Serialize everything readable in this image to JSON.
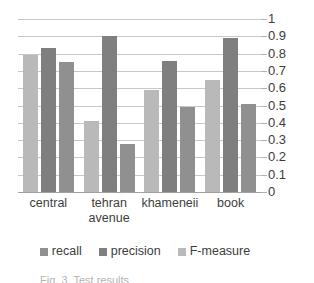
{
  "chart_data": {
    "type": "bar",
    "title": "",
    "xlabel": "",
    "ylabel": "",
    "ylim": [
      0,
      1
    ],
    "ytick_labels": [
      "1",
      "0.9",
      "0.8",
      "0.7",
      "0.6",
      "0.5",
      "0.4",
      "0.3",
      "0.2",
      "0.1",
      "0"
    ],
    "ytick_values": [
      1,
      0.9,
      0.8,
      0.7,
      0.6,
      0.5,
      0.4,
      0.3,
      0.2,
      0.1,
      0
    ],
    "grid": true,
    "legend_position": "bottom",
    "categories": [
      "central",
      "tehran avenue",
      "khameneii",
      "book"
    ],
    "series": [
      {
        "name": "F-measure",
        "color": "#b9b9b9",
        "values": [
          0.79,
          0.41,
          0.59,
          0.65
        ]
      },
      {
        "name": "precision",
        "color": "#7f7f7f",
        "values": [
          0.83,
          0.9,
          0.755,
          0.89
        ]
      },
      {
        "name": "recall",
        "color": "#909090",
        "values": [
          0.75,
          0.275,
          0.49,
          0.51
        ]
      }
    ],
    "legend_order": [
      "recall",
      "precision",
      "F-measure"
    ]
  },
  "axis": {
    "y_labels": [
      "1",
      "0.9",
      "0.8",
      "0.7",
      "0.6",
      "0.5",
      "0.4",
      "0.3",
      "0.2",
      "0.1",
      "0"
    ],
    "x_labels": [
      {
        "line1": "central",
        "line2": ""
      },
      {
        "line1": "tehran",
        "line2": "avenue"
      },
      {
        "line1": "khameneii",
        "line2": ""
      },
      {
        "line1": "book",
        "line2": ""
      }
    ]
  },
  "legend": {
    "items": [
      {
        "label": "recall",
        "color": "#909090"
      },
      {
        "label": "precision",
        "color": "#7f7f7f"
      },
      {
        "label": "F-measure",
        "color": "#b9b9b9"
      }
    ]
  },
  "caption": {
    "text": "Fig. 3.  Test results"
  },
  "colors": {
    "f_measure": "#b9b9b9",
    "precision": "#7f7f7f",
    "recall": "#909090",
    "gridline": "#9a9a9a",
    "text": "#3d3d3d"
  }
}
